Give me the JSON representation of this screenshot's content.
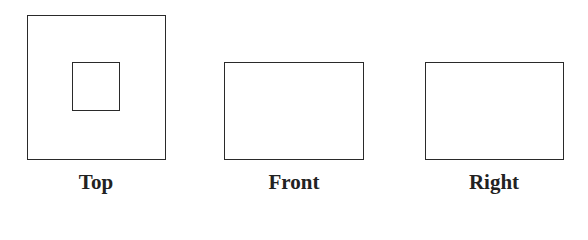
{
  "diagram": {
    "type": "orthographic-views",
    "views": [
      {
        "label": "Top",
        "shape": "square with inner square"
      },
      {
        "label": "Front",
        "shape": "rectangle"
      },
      {
        "label": "Right",
        "shape": "rectangle"
      }
    ]
  },
  "colors": {
    "stroke": "#2a2a2a",
    "text": "#222222",
    "background": "#ffffff"
  }
}
